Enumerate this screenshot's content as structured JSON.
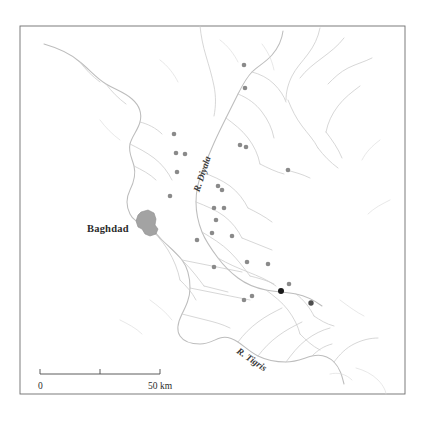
{
  "figure": {
    "type": "map",
    "region": "Diyala–Tigris confluence region, central Iraq",
    "background_color": "#ffffff",
    "frame_color": "#6e6e6e"
  },
  "labels": {
    "city": {
      "name": "Baghdad",
      "x": 87,
      "y": 228
    },
    "rivers": [
      {
        "name": "R. Diyala",
        "x": 205,
        "y": 175,
        "rotation": -72
      },
      {
        "name": "R. Tigris",
        "x": 233,
        "y": 360,
        "rotation": 37
      }
    ]
  },
  "scale_bar": {
    "start_label": "0",
    "end_label": "50 km",
    "mid_tick": true,
    "x_start": 40,
    "x_end": 160,
    "y": 375,
    "label_y": 389
  },
  "colors": {
    "river": "#c9c9c9",
    "river_major": "#bdbdbd",
    "river_faint": "#dcdcdc",
    "city_fill": "#a3a3a3",
    "site_dot": "#8a8a8a",
    "site_dot_dark": "#1a1a1a",
    "site_dot_mid": "#4d4d4d",
    "frame": "#6e6e6e",
    "text": "#2b2b2b"
  },
  "frame": {
    "x": 20,
    "y": 26,
    "width": 385,
    "height": 368
  },
  "city_polygon": "M141,212 L148,210 L154,213 L156,219 L155,225 L158,229 L156,234 L150,236 L145,234 L142,229 L138,227 L136,221 L138,215 Z",
  "sites": [
    {
      "x": 174,
      "y": 134,
      "size": 2.3,
      "tone": "light"
    },
    {
      "x": 176,
      "y": 153,
      "size": 2.3,
      "tone": "light"
    },
    {
      "x": 177,
      "y": 172,
      "size": 2.3,
      "tone": "light"
    },
    {
      "x": 185,
      "y": 154,
      "size": 2.3,
      "tone": "light"
    },
    {
      "x": 170,
      "y": 196,
      "size": 2.3,
      "tone": "light"
    },
    {
      "x": 244,
      "y": 65,
      "size": 2.3,
      "tone": "light"
    },
    {
      "x": 245,
      "y": 88,
      "size": 2.3,
      "tone": "light"
    },
    {
      "x": 240,
      "y": 145,
      "size": 2.3,
      "tone": "light"
    },
    {
      "x": 246,
      "y": 147,
      "size": 2.3,
      "tone": "light"
    },
    {
      "x": 288,
      "y": 170,
      "size": 2.3,
      "tone": "light"
    },
    {
      "x": 218,
      "y": 186,
      "size": 2.3,
      "tone": "light"
    },
    {
      "x": 222,
      "y": 190,
      "size": 2.3,
      "tone": "light"
    },
    {
      "x": 214,
      "y": 208,
      "size": 2.3,
      "tone": "light"
    },
    {
      "x": 224,
      "y": 208,
      "size": 2.3,
      "tone": "light"
    },
    {
      "x": 216,
      "y": 220,
      "size": 2.3,
      "tone": "light"
    },
    {
      "x": 212,
      "y": 233,
      "size": 2.3,
      "tone": "light"
    },
    {
      "x": 232,
      "y": 236,
      "size": 2.3,
      "tone": "light"
    },
    {
      "x": 197,
      "y": 240,
      "size": 2.3,
      "tone": "light"
    },
    {
      "x": 214,
      "y": 267,
      "size": 2.3,
      "tone": "light"
    },
    {
      "x": 247,
      "y": 262,
      "size": 2.3,
      "tone": "light"
    },
    {
      "x": 268,
      "y": 264,
      "size": 2.3,
      "tone": "light"
    },
    {
      "x": 289,
      "y": 284,
      "size": 2.3,
      "tone": "light"
    },
    {
      "x": 281,
      "y": 291,
      "size": 3.0,
      "tone": "dark"
    },
    {
      "x": 311,
      "y": 303,
      "size": 2.7,
      "tone": "mid"
    },
    {
      "x": 244,
      "y": 300,
      "size": 2.3,
      "tone": "light"
    },
    {
      "x": 252,
      "y": 296,
      "size": 2.3,
      "tone": "light"
    }
  ],
  "rivers_paths": {
    "tigris_main": "M44,44 C58,48 70,53 80,62 C90,70 96,78 106,84 C116,90 124,92 132,99 C140,106 142,114 140,122 C138,130 132,136 130,144 C128,152 132,158 134,166 C136,174 134,182 130,190 C126,198 126,206 130,214 C134,222 140,222 146,225 C152,228 156,234 162,240 C168,246 176,252 182,260 C188,268 190,278 190,288 C190,298 186,306 182,314 C178,322 176,330 180,336 C184,342 192,344 200,344 C208,344 214,340 220,338 C226,336 232,338 238,342 C244,346 250,352 258,356 C266,360 276,362 286,362 C296,362 304,358 312,356 C320,354 328,356 334,362 C340,368 342,376 344,384",
    "diyala_main": "M283,31 C282,40 278,48 272,55 C266,62 258,66 252,72 C246,78 242,86 238,94 C234,102 230,110 226,118 C222,126 218,134 214,143 C210,152 206,162 202,172 C198,182 196,192 196,202 C196,212 198,222 202,232 C206,242 212,250 218,258 C224,266 230,272 238,278 C246,284 256,288 266,290 C276,292 286,292 296,294 C306,296 314,300 322,306",
    "upper_branch_a": "M200,26 C201,36 203,46 206,56 C209,66 212,76 214,86 C216,96 216,106 214,116",
    "upper_branch_b": "M320,28 C318,38 314,46 308,54 C302,62 296,68 292,76 C288,84 286,92 286,100",
    "branch_c": "M344,38 C338,46 330,52 322,58 C314,64 306,70 300,78",
    "branch_d": "M372,58 C364,62 356,64 348,68 C340,72 334,78 328,84",
    "branch_e": "M288,100 C292,110 296,118 302,126 C308,134 314,140 318,148",
    "branch_f": "M252,72 C260,74 268,78 274,84 C280,90 284,96 286,102",
    "branch_g": "M238,94 C248,98 256,104 262,112 C268,120 272,128 274,138",
    "branch_h": "M226,118 C234,124 242,130 248,138 C254,146 258,154 260,164",
    "branch_i": "M202,172 C212,176 222,180 230,186 C238,192 244,200 248,208",
    "branch_j": "M196,202 C206,206 216,210 224,216 C232,222 238,230 242,238",
    "branch_k": "M202,232 C212,238 222,244 230,252 C238,260 244,268 250,276",
    "branch_l": "M218,258 C228,264 238,268 248,272 C258,276 268,280 276,286",
    "branch_m": "M266,290 C274,296 282,302 288,310 C294,318 298,326 300,334",
    "branch_n": "M296,294 C304,300 310,308 314,316",
    "branch_o": "M160,238 C168,246 176,254 184,262 C192,270 198,278 204,286",
    "branch_p": "M146,225 C154,232 162,240 168,250 C174,260 178,270 180,280",
    "branch_q": "M182,260 C192,262 202,264 212,266 C222,268 232,270 242,272",
    "branch_r": "M190,288 C200,290 210,292 220,294 C230,296 240,298 250,300",
    "branch_s": "M182,314 C190,316 198,318 206,320 C214,322 222,324 230,328",
    "branch_t": "M238,342 C244,334 250,328 258,322 C266,316 274,312 282,308",
    "branch_u": "M258,356 C264,348 270,342 278,336 C286,330 294,326 302,322",
    "branch_v": "M286,362 C292,354 298,346 306,340 C314,334 322,330 330,328",
    "branch_w": "M334,362 C340,354 346,348 354,344 C362,340 370,338 378,338",
    "branch_x": "M312,356 C318,350 324,346 332,344",
    "branch_y": "M130,144 C138,148 146,152 154,158 C162,164 168,172 172,180",
    "branch_z": "M134,166 C142,170 150,174 156,180",
    "branch_aa": "M140,122 C148,124 156,128 162,134",
    "branch_ab": "M106,84 C112,92 118,98 126,104",
    "branch_ac": "M80,62 C86,70 92,76 100,82",
    "branch_ad": "M360,86 C352,92 344,98 338,106 C332,114 328,122 326,132",
    "branch_ae": "M326,132 C332,140 338,148 342,158",
    "branch_af": "M318,148 C324,156 330,162 338,168",
    "branch_ag": "M286,170 C294,172 302,174 310,178",
    "branch_ah": "M260,164 C268,168 276,172 284,174",
    "branch_ai": "M248,208 C256,212 264,216 272,222",
    "branch_aj": "M242,238 C252,242 262,246 272,250",
    "branch_ak": "M250,276 C258,278 266,280 274,284",
    "branch_al": "M204,286 C212,288 220,290 228,292",
    "branch_am": "M180,280 C186,286 192,292 196,300",
    "branch_an": "M300,334 C306,340 312,346 320,350",
    "branch_ao": "M314,316 C320,320 326,324 334,326"
  },
  "rivers_faint": {
    "f1": "M340,300 C348,306 356,312 364,316",
    "f2": "M356,368 C364,370 372,374 378,380 C384,386 386,392 386,394",
    "f3": "M330,374 C338,372 346,374 352,380",
    "f4": "M100,120 C106,128 112,134 120,140",
    "f5": "M160,60 C168,66 174,74 178,82",
    "f6": "M220,40 C228,46 234,54 238,62",
    "f7": "M262,44 C268,52 272,60 274,70",
    "f8": "M380,140 C372,146 366,152 362,160",
    "f9": "M390,200 C382,204 374,208 368,214",
    "f10": "M150,300 C158,306 166,312 172,320",
    "f11": "M120,320 C128,324 136,328 142,334"
  }
}
